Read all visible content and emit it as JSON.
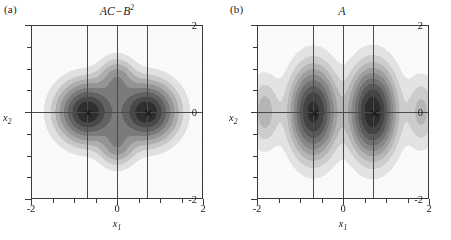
{
  "figure": {
    "background": "#ffffff",
    "ink_color": "#1a1a1a"
  },
  "panels": [
    {
      "key": "a",
      "label": "(a)",
      "title_main": "AC",
      "title_op": "−",
      "title_var": "B",
      "title_sup": "2",
      "title_plain": "AC − B²",
      "axis": {
        "x_name": "x",
        "x_sub": "1",
        "y_name": "x",
        "y_sub": "2",
        "x_ticks": [
          "-2",
          "0",
          "2"
        ],
        "y_ticks": [
          "2",
          "0",
          "-2"
        ],
        "xlim": [
          -2,
          2
        ],
        "ylim": [
          -2,
          2
        ]
      },
      "gridlines_x": [
        -0.7,
        0,
        0.7
      ],
      "gridlines_y": [
        0
      ],
      "markers": [
        {
          "x": -0.7,
          "y": 0,
          "glyph": "x"
        },
        {
          "x": 0.7,
          "y": 0,
          "glyph": "x"
        }
      ]
    },
    {
      "key": "b",
      "label": "(b)",
      "title_main": "A",
      "title_op": "",
      "title_var": "",
      "title_sup": "",
      "title_plain": "A",
      "axis": {
        "x_name": "x",
        "x_sub": "1",
        "y_name": "x",
        "y_sub": "2",
        "x_ticks": [
          "-2",
          "0",
          "2"
        ],
        "y_ticks": [
          "2",
          "0",
          "-2"
        ],
        "xlim": [
          -2,
          2
        ],
        "ylim": [
          -2,
          2
        ]
      },
      "gridlines_x": [
        -0.7,
        0,
        0.7
      ],
      "gridlines_y": [
        0
      ],
      "markers": [
        {
          "x": -0.7,
          "y": 0,
          "glyph": "x"
        },
        {
          "x": 0.7,
          "y": 0,
          "glyph": "x"
        }
      ]
    }
  ],
  "chart_data": [
    {
      "type": "heatmap",
      "panel": "a",
      "title": "AC − B²",
      "xlabel": "x₁",
      "ylabel": "x₂",
      "xlim": [
        -2,
        2
      ],
      "ylim": [
        -2,
        2
      ],
      "grid": true,
      "colormap": "grayscale-inverted",
      "legend": "none",
      "description": "Four-lobed quadrupolar density: two strong dark lobes on the x1 axis at (±0.7, 0) and two weaker lobes on the x2 axis at (0, ±0.75); background near zero.",
      "lobes": [
        {
          "cx": -0.7,
          "cy": 0.0,
          "sx": 0.42,
          "sy": 0.42,
          "peak": 1.0
        },
        {
          "cx": 0.7,
          "cy": 0.0,
          "sx": 0.42,
          "sy": 0.42,
          "peak": 1.0
        },
        {
          "cx": 0.0,
          "cy": 0.78,
          "sx": 0.26,
          "sy": 0.3,
          "peak": 0.35
        },
        {
          "cx": 0.0,
          "cy": -0.78,
          "sx": 0.26,
          "sy": 0.3,
          "peak": 0.35
        }
      ],
      "contour_levels": [
        0.05,
        0.12,
        0.2,
        0.3,
        0.42,
        0.55,
        0.7,
        0.85,
        1.0
      ],
      "annotations": [
        {
          "x": -0.7,
          "y": 0,
          "marker": "x"
        },
        {
          "x": 0.7,
          "y": 0,
          "marker": "x"
        }
      ]
    },
    {
      "type": "heatmap",
      "panel": "b",
      "title": "A",
      "xlabel": "x₁",
      "ylabel": "x₂",
      "xlim": [
        -2,
        2
      ],
      "ylim": [
        -2,
        2
      ],
      "grid": true,
      "colormap": "grayscale-inverted",
      "legend": "none",
      "description": "Two tall vertically elongated dark lobes centred at (±0.7, 0) with concentric contour rings, plus faint secondary lobes near x1 = ±1.8 on the x2 = 0 line.",
      "lobes": [
        {
          "cx": -0.7,
          "cy": 0.0,
          "sx": 0.33,
          "sy": 0.62,
          "peak": 0.92
        },
        {
          "cx": 0.7,
          "cy": 0.0,
          "sx": 0.33,
          "sy": 0.62,
          "peak": 1.0
        },
        {
          "cx": -1.85,
          "cy": 0.0,
          "sx": 0.22,
          "sy": 0.5,
          "peak": 0.22
        },
        {
          "cx": 1.85,
          "cy": 0.0,
          "sx": 0.22,
          "sy": 0.5,
          "peak": 0.2
        }
      ],
      "contour_levels": [
        0.04,
        0.1,
        0.17,
        0.25,
        0.34,
        0.45,
        0.57,
        0.7,
        0.85,
        1.0
      ],
      "annotations": [
        {
          "x": -0.7,
          "y": 0,
          "marker": "x"
        },
        {
          "x": 0.7,
          "y": 0,
          "marker": "x"
        }
      ]
    }
  ]
}
